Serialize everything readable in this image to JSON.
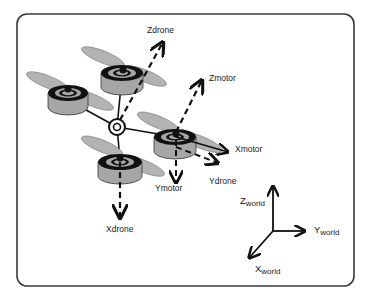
{
  "figure": {
    "colors": {
      "frame_border": "#3a3a3a",
      "motor_fill": "#a6a6a6",
      "propeller_fill": "#b3b3b3",
      "ink": "#111111",
      "background": "#ffffff"
    }
  },
  "labels": {
    "zdrone": "Zdrone",
    "zmotor": "Zmotor",
    "xmotor": "Xmotor",
    "ydrone": "Ydrone",
    "ymotor": "Ymotor",
    "xdrone": "Xdrone",
    "zworld_base": "Z",
    "zworld_sub": "world",
    "yworld_base": "Y",
    "yworld_sub": "world",
    "xworld_base": "X",
    "xworld_sub": "world"
  },
  "frames": [
    {
      "name": "drone",
      "axes": [
        "Xdrone",
        "Ydrone",
        "Zdrone"
      ],
      "style": "dashed"
    },
    {
      "name": "motor",
      "axes": [
        "Xmotor",
        "Ymotor",
        "Zmotor"
      ],
      "style": "dashed/solid"
    },
    {
      "name": "world",
      "axes": [
        "Xworld",
        "Yworld",
        "Zworld"
      ],
      "style": "solid"
    }
  ],
  "components": {
    "motors": 4,
    "propellers_per_motor": 2,
    "hub": 1
  }
}
